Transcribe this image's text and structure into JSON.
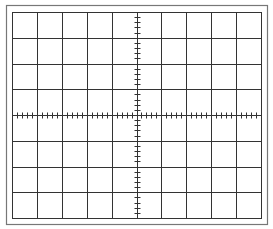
{
  "diagram": {
    "type": "oscilloscope-graticule",
    "columns": 10,
    "rows": 8,
    "minor_ticks_per_division": 5,
    "colors": {
      "background": "#ffffff",
      "grid_line": "#333333",
      "outer_frame": "#777777"
    },
    "geometry": {
      "outer_frame": {
        "x": 6,
        "y": 5,
        "w": 261,
        "h": 219
      },
      "grid": {
        "x": 12,
        "y": 12,
        "w": 249,
        "h": 206
      },
      "tick_half_length": 3
    }
  }
}
